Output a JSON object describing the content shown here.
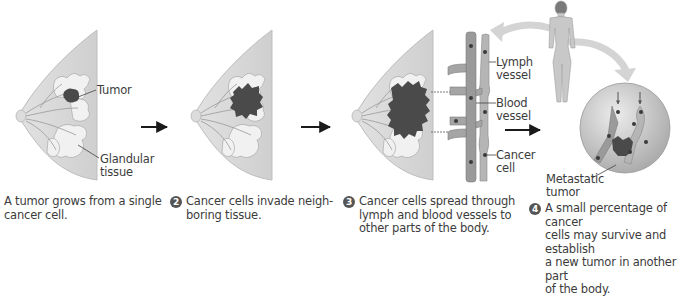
{
  "labels": {
    "tumor": "Tumor",
    "glandular_1": "Glandular",
    "glandular_2": "tissue",
    "lymph_1": "Lymph",
    "lymph_2": "vessel",
    "blood_1": "Blood",
    "blood_2": "vessel",
    "cancer_1": "Cancer",
    "cancer_2": "cell",
    "metastatic_1": "Metastatic",
    "metastatic_2": "tumor"
  },
  "steps": [
    {
      "number": "",
      "lines": [
        "A tumor grows from a single",
        "cancer cell."
      ]
    },
    {
      "number": "2",
      "lines": [
        "Cancer cells invade neigh-",
        "boring tissue."
      ]
    },
    {
      "number": "3",
      "lines": [
        "Cancer cells spread through",
        "lymph and blood vessels to",
        "other parts of the body."
      ]
    },
    {
      "number": "4",
      "lines": [
        "A small percentage of cancer",
        "cells may survive and establish",
        "a new tumor in another part",
        "of the body."
      ]
    }
  ],
  "colors": {
    "tissue": "#d9d9d9",
    "gland": "#ececec",
    "tumor": "#4a4a4a",
    "vessel": "#9a9a9a",
    "arrow": "#1a1a1a",
    "curved_arrow": "#d4d4d4"
  }
}
